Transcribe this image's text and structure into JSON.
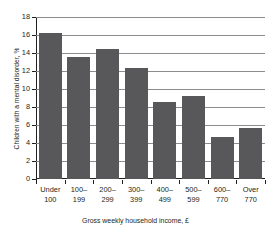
{
  "chart_data": {
    "type": "bar",
    "title": "",
    "xlabel": "Gross weekly household income, £",
    "ylabel": "Children with a mental disorder, %",
    "categories": [
      "Under 100",
      "100–199",
      "200–299",
      "300–399",
      "400–499",
      "500–599",
      "600–770",
      "Over 770"
    ],
    "category_lines": [
      [
        "Under",
        "100"
      ],
      [
        "100–",
        "199"
      ],
      [
        "200–",
        "299"
      ],
      [
        "300–",
        "399"
      ],
      [
        "400–",
        "499"
      ],
      [
        "500–",
        "599"
      ],
      [
        "600–",
        "770"
      ],
      [
        "Over",
        "770"
      ]
    ],
    "values": [
      16.2,
      13.6,
      14.5,
      12.3,
      8.6,
      9.2,
      4.7,
      5.7
    ],
    "ylim": [
      0,
      18
    ],
    "yticks": [
      0,
      2,
      4,
      6,
      8,
      10,
      12,
      14,
      16,
      18
    ],
    "ytick_labels": [
      "0",
      "2",
      "4",
      "6",
      "8",
      "10",
      "12",
      "14",
      "16",
      "18"
    ],
    "grid": true,
    "legend": false,
    "bar_color": "#58585a",
    "axis_color": "#231f20",
    "grid_color": "#8c8c8e",
    "background": "#ffffff"
  }
}
